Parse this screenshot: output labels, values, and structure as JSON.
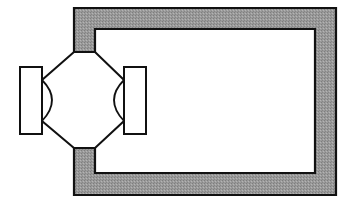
{
  "diagram": {
    "colors": {
      "frame_fill": "#9a9a9a",
      "stroke": "#111111",
      "background": "#ffffff"
    },
    "components": [
      {
        "name": "frame",
        "label": "hatched rectangular frame"
      },
      {
        "name": "octagon-body",
        "label": "octagonal central body"
      },
      {
        "name": "left-plate",
        "label": "left rectangular plate"
      },
      {
        "name": "right-plate",
        "label": "right rectangular plate"
      },
      {
        "name": "left-lens",
        "label": "left curved element"
      },
      {
        "name": "right-lens",
        "label": "right curved element"
      }
    ]
  }
}
